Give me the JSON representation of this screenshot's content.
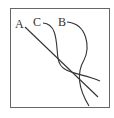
{
  "diagram": {
    "labels": {
      "a": "A",
      "b": "B",
      "c": "C"
    },
    "colors": {
      "frame": "#666666",
      "curve": "#333333",
      "background": "#ffffff"
    }
  }
}
